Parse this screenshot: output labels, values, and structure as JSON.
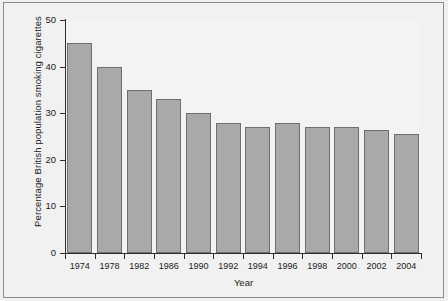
{
  "chart_data": {
    "type": "bar",
    "title": "",
    "xlabel": "Year",
    "ylabel": "Percentage British population smoking cigarettes",
    "categories": [
      "1974",
      "1978",
      "1982",
      "1986",
      "1990",
      "1992",
      "1994",
      "1996",
      "1998",
      "2000",
      "2002",
      "2004"
    ],
    "values": [
      45,
      40,
      35,
      33,
      30,
      28,
      27,
      28,
      27,
      27,
      26.5,
      25.5
    ],
    "ylim": [
      0,
      50
    ],
    "yticks": [
      0,
      10,
      20,
      30,
      40,
      50
    ],
    "ytick_labels": [
      "0",
      "10",
      "20",
      "30",
      "40",
      "50"
    ],
    "grid": false,
    "legend": false,
    "bar_color": "#a9a9a9",
    "bar_edge_color": "#6e6e6e",
    "axis_color": "#2e2e2e",
    "plot_background": "#f3f3f3",
    "figure_background": "#f1f1f1"
  }
}
